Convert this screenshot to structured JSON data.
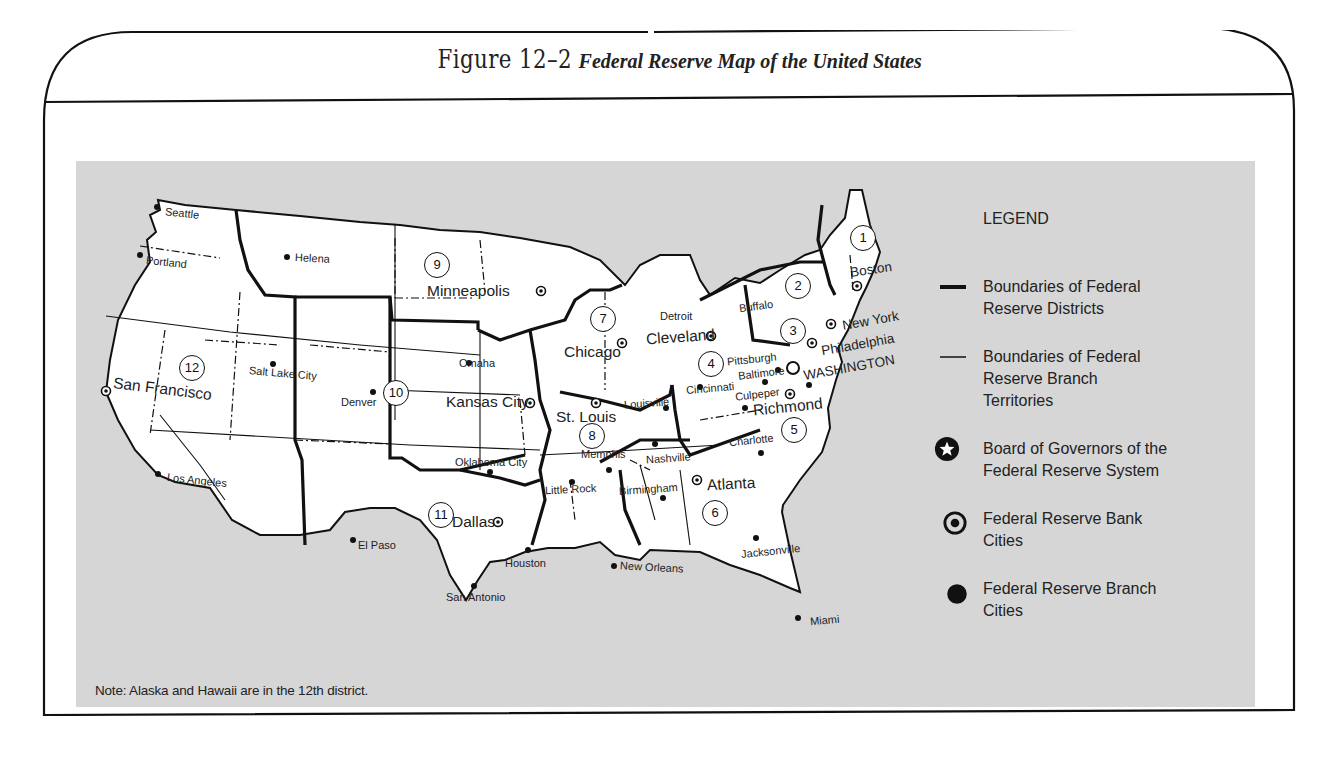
{
  "figure": {
    "number_label": "Figure 12–2",
    "caption": "Federal Reserve Map of the United States"
  },
  "legend": {
    "heading": "LEGEND",
    "items": [
      {
        "symbol": "thick-line",
        "label": "Boundaries of Federal\nReserve Districts"
      },
      {
        "symbol": "thin-line",
        "label": "Boundaries of Federal\nReserve Branch\nTerritories"
      },
      {
        "symbol": "star-in-circle",
        "label": "Board of Governors of the\nFederal Reserve System"
      },
      {
        "symbol": "dot-in-circle",
        "label": "Federal Reserve Bank\nCities"
      },
      {
        "symbol": "filled-dot",
        "label": "Federal Reserve Branch\nCities"
      }
    ]
  },
  "note": "Note: Alaska and Hawaii are in the 12th district.",
  "districts": [
    {
      "number": "1",
      "bank_city": "Boston"
    },
    {
      "number": "2",
      "bank_city": "New York"
    },
    {
      "number": "3",
      "bank_city": "Philadelphia"
    },
    {
      "number": "4",
      "bank_city": "Cleveland"
    },
    {
      "number": "5",
      "bank_city": "Richmond"
    },
    {
      "number": "6",
      "bank_city": "Atlanta"
    },
    {
      "number": "7",
      "bank_city": "Chicago"
    },
    {
      "number": "8",
      "bank_city": "St. Louis"
    },
    {
      "number": "9",
      "bank_city": "Minneapolis"
    },
    {
      "number": "10",
      "bank_city": "Kansas City"
    },
    {
      "number": "11",
      "bank_city": "Dallas"
    },
    {
      "number": "12",
      "bank_city": "San Francisco"
    }
  ],
  "board_of_governors": "WASHINGTON",
  "bank_cities": [
    "Boston",
    "New York",
    "Philadelphia",
    "Cleveland",
    "Richmond",
    "Atlanta",
    "Chicago",
    "St. Louis",
    "Minneapolis",
    "Kansas City",
    "Dallas",
    "San Francisco"
  ],
  "branch_cities": [
    "Seattle",
    "Portland",
    "Helena",
    "Salt Lake City",
    "Los Angeles",
    "Denver",
    "Omaha",
    "Oklahoma City",
    "El Paso",
    "Houston",
    "San Antonio",
    "Detroit",
    "Buffalo",
    "Pittsburgh",
    "Cincinnati",
    "Baltimore",
    "Culpeper",
    "Charlotte",
    "Louisville",
    "Memphis",
    "Little Rock",
    "Nashville",
    "Birmingham",
    "New Orleans",
    "Jacksonville",
    "Miami"
  ],
  "labels": {
    "seattle": "Seattle",
    "portland": "Portland",
    "helena": "Helena",
    "san_francisco": "San Francisco",
    "salt_lake_city": "Salt Lake City",
    "los_angeles": "Los Angeles",
    "denver": "Denver",
    "minneapolis": "Minneapolis",
    "omaha": "Omaha",
    "kansas_city": "Kansas City",
    "oklahoma_city": "Oklahoma City",
    "dallas": "Dallas",
    "el_paso": "El Paso",
    "houston": "Houston",
    "san_antonio": "San Antonio",
    "chicago": "Chicago",
    "detroit": "Detroit",
    "st_louis": "St. Louis",
    "louisville": "Louisville",
    "memphis": "Memphis",
    "little_rock": "Little Rock",
    "nashville": "Nashville",
    "birmingham": "Birmingham",
    "new_orleans": "New Orleans",
    "atlanta": "Atlanta",
    "jacksonville": "Jacksonville",
    "miami": "Miami",
    "cleveland": "Cleveland",
    "cincinnati": "Cincinnati",
    "pittsburgh": "Pittsburgh",
    "buffalo": "Buffalo",
    "baltimore": "Baltimore",
    "culpeper": "Culpeper",
    "richmond": "Richmond",
    "charlotte": "Charlotte",
    "washington": "WASHINGTON",
    "philadelphia": "Philadelphia",
    "new_york": "New York",
    "boston": "Boston"
  },
  "colors": {
    "panel_background": "#d6d6d6",
    "land": "#ffffff",
    "lines": "#111111",
    "text": "#222222"
  }
}
